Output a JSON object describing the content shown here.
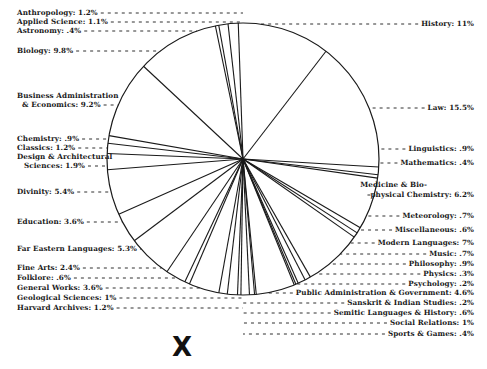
{
  "chart_data": {
    "type": "pie",
    "title": "",
    "categories": [
      "Anthropology",
      "Applied Science",
      "Astronomy",
      "Biology",
      "Business Administration & Economics",
      "Chemistry",
      "Classics",
      "Design & Architectural Sciences",
      "Divinity",
      "Education",
      "Far Eastern Languages",
      "Fine Arts",
      "Folklore",
      "General Works",
      "Geological Sciences",
      "Harvard Archives",
      "History",
      "Law",
      "Linguistics",
      "Mathematics",
      "Medicine & Bio-physical Chemistry",
      "Meteorology",
      "Miscellaneous",
      "Modern Languages",
      "Music",
      "Philosophy",
      "Physics",
      "Psychology",
      "Public Administration & Government",
      "Sanskrit & Indian Studies",
      "Semitic Languages & History",
      "Social Relations",
      "Sports & Games"
    ],
    "values": [
      1.2,
      1.1,
      0.4,
      9.8,
      9.2,
      0.9,
      1.2,
      1.9,
      5.4,
      3.6,
      5.3,
      2.4,
      0.6,
      3.6,
      1.0,
      1.2,
      11.0,
      15.5,
      0.9,
      0.4,
      6.2,
      0.7,
      0.6,
      7.0,
      0.7,
      0.9,
      0.3,
      0.2,
      4.6,
      0.2,
      0.6,
      1.0,
      0.4
    ],
    "unit": "%",
    "legend": "none (leader-line labels)"
  },
  "labels_left": [
    {
      "text": "Anthropology: 1.2%",
      "x": 17,
      "y": 14
    },
    {
      "text": "Applied Science: 1.1%",
      "x": 17,
      "y": 23
    },
    {
      "text": "Astronomy: .4%",
      "x": 17,
      "y": 32
    },
    {
      "text": "Biology: 9.8%",
      "x": 17,
      "y": 52
    },
    {
      "text": "Business Administration",
      "x": 17,
      "y": 97
    },
    {
      "text": "& Economics: 9.2%",
      "x": 22,
      "y": 106
    },
    {
      "text": "Chemistry: .9%",
      "x": 17,
      "y": 140
    },
    {
      "text": "Classics: 1.2%",
      "x": 17,
      "y": 149
    },
    {
      "text": "Design & Architectural",
      "x": 17,
      "y": 158
    },
    {
      "text": "Sciences: 1.9%",
      "x": 24,
      "y": 167
    },
    {
      "text": "Divinity: 5.4%",
      "x": 17,
      "y": 193
    },
    {
      "text": "Education: 3.6%",
      "x": 17,
      "y": 223
    },
    {
      "text": "Far Eastern Languages: 5.3%",
      "x": 17,
      "y": 250
    },
    {
      "text": "Fine Arts: 2.4%",
      "x": 17,
      "y": 269
    },
    {
      "text": "Folklore: .6%",
      "x": 17,
      "y": 279
    },
    {
      "text": "General Works: 3.6%",
      "x": 17,
      "y": 289
    },
    {
      "text": "Geological Sciences: 1%",
      "x": 17,
      "y": 299
    },
    {
      "text": "Harvard Archives: 1.2%",
      "x": 17,
      "y": 309
    }
  ],
  "labels_right": [
    {
      "text": "History: 11%",
      "right": 13,
      "y": 25
    },
    {
      "text": "Law: 15.5%",
      "right": 13,
      "y": 109
    },
    {
      "text": "Linguistics: .9%",
      "right": 13,
      "y": 150
    },
    {
      "text": "Mathematics: .4%",
      "right": 13,
      "y": 164
    },
    {
      "text": "Medicine & Bio-",
      "right": 60,
      "y": 186
    },
    {
      "text": "physical Chemistry: 6.2%",
      "right": 13,
      "y": 196
    },
    {
      "text": "Meteorology: .7%",
      "right": 13,
      "y": 217
    },
    {
      "text": "Miscellaneous: .6%",
      "right": 13,
      "y": 231
    },
    {
      "text": "Modern Languages: 7%",
      "right": 13,
      "y": 244
    },
    {
      "text": "Music: .7%",
      "right": 13,
      "y": 255
    },
    {
      "text": "Philosophy: .9%",
      "right": 13,
      "y": 265
    },
    {
      "text": "Physics: .3%",
      "right": 13,
      "y": 275
    },
    {
      "text": "Psychology: .2%",
      "right": 13,
      "y": 285
    },
    {
      "text": "Public Administration & Government: 4.6%",
      "right": 13,
      "y": 294
    },
    {
      "text": "Sanskrit & Indian Studies: .2%",
      "right": 13,
      "y": 304
    },
    {
      "text": "Semitic Languages & History: .6%",
      "right": 13,
      "y": 314
    },
    {
      "text": "Social Relations: 1%",
      "right": 13,
      "y": 324
    },
    {
      "text": "Sports & Games: .4%",
      "right": 13,
      "y": 335
    }
  ],
  "mark": "X"
}
